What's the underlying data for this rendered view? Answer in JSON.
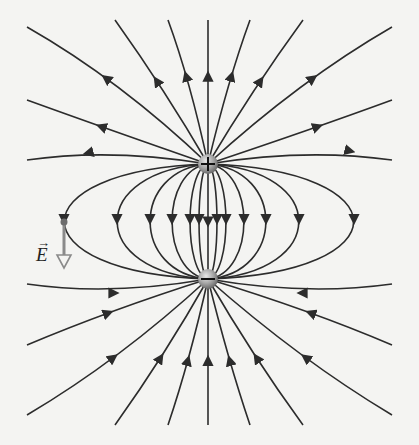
{
  "diagram": {
    "charges": [
      {
        "sign": "+",
        "label": "positive-charge",
        "x": 208,
        "y": 164
      },
      {
        "sign": "−",
        "label": "negative-charge",
        "x": 208,
        "y": 279
      }
    ],
    "field_vector": {
      "label": "E",
      "point": {
        "x": 64,
        "y": 222
      },
      "direction": "down"
    },
    "colors": {
      "line": "#2c2c2c",
      "background": "#f4f4f2",
      "vector": "#8a8a8a",
      "charge": "#9a9a9a"
    },
    "line_count_per_charge": 24
  }
}
